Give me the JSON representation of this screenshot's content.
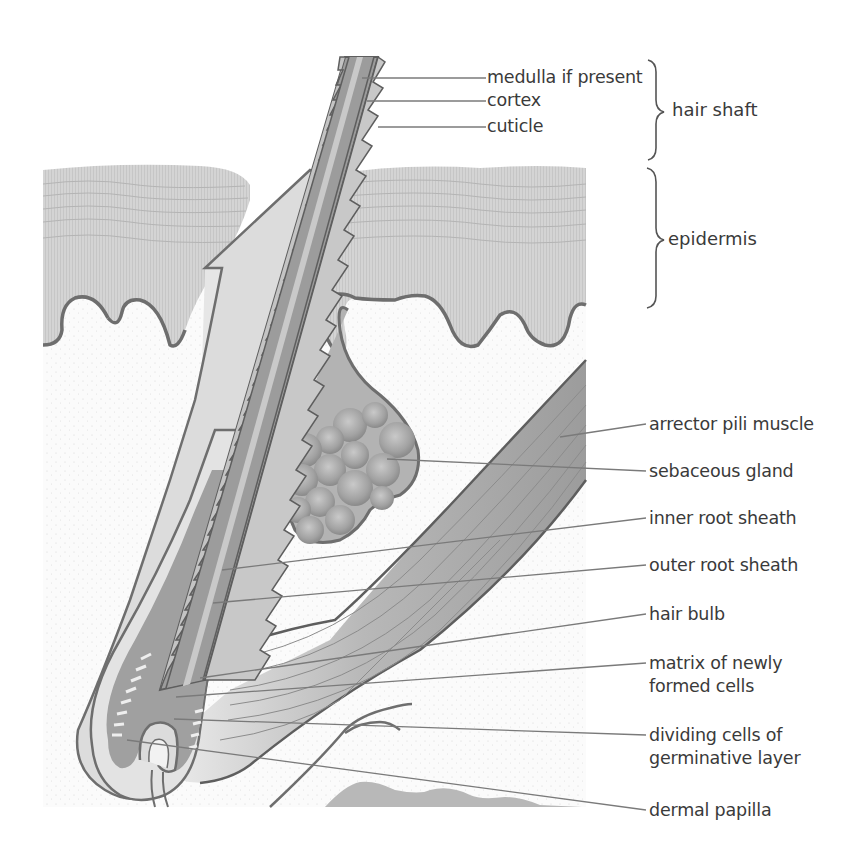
{
  "figure": {
    "colors": {
      "background": "#ffffff",
      "epidermis": "#d2d2d2",
      "epidermis_stripe": "#c4c4c4",
      "dermis": "#fafafa",
      "outline": "#6e6e6e",
      "hair_cortex": "#9a9a9a",
      "medulla": "#c8c8c8",
      "cuticle": "#bdbdbd",
      "sheath": "#d9d9d9",
      "gland": "#a9a9a9",
      "muscle": "#a4a4a4",
      "leader_line": "#7a7a7a",
      "text": "#3a3a3a"
    }
  },
  "labels": {
    "medulla": "medulla if present",
    "cortex": "cortex",
    "cuticle": "cuticle",
    "arrector": "arrector pili muscle",
    "sebaceous": "sebaceous gland",
    "inner_root": "inner root sheath",
    "outer_root": "outer root sheath",
    "hair_bulb": "hair bulb",
    "matrix_1": "matrix of newly",
    "matrix_2": "formed cells",
    "dividing_1": "dividing cells of",
    "dividing_2": "germinative layer",
    "dermal_papilla": "dermal papilla"
  },
  "groups": {
    "hair_shaft": "hair shaft",
    "epidermis": "epidermis"
  }
}
